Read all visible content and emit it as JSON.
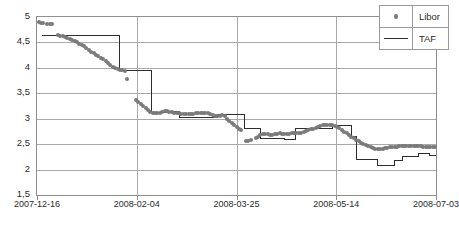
{
  "chart_data": {
    "type": "scatter",
    "title": "",
    "xlabel": "",
    "ylabel": "",
    "ylim": [
      1.5,
      5.0
    ],
    "ytick_values": [
      5,
      4.5,
      4,
      3.5,
      3,
      2.5,
      2,
      1.5
    ],
    "ytick_labels": [
      "5",
      "4,5",
      "4",
      "3,5",
      "3",
      "2,5",
      "2",
      "1,5"
    ],
    "xtick_labels": [
      "2007-12-16",
      "2008-02-04",
      "2008-03-25",
      "2008-05-14",
      "2008-07-03"
    ],
    "xtick_positions": [
      0,
      0.25,
      0.5,
      0.75,
      1.0
    ],
    "grid": true,
    "legend_position": "top-right",
    "colors": {
      "libor": "#7a7a7a",
      "taf": "#2e2e2e",
      "grid": "#a9a9a9",
      "frame": "#8e8e8e",
      "background": "#ffffff"
    },
    "series": [
      {
        "name": "Libor",
        "type": "scatter",
        "marker": "circle",
        "color": "#7a7a7a",
        "points": [
          [
            0.004,
            4.9
          ],
          [
            0.01,
            4.89
          ],
          [
            0.016,
            4.89
          ],
          [
            0.026,
            4.87
          ],
          [
            0.032,
            4.87
          ],
          [
            0.038,
            4.86
          ],
          [
            0.052,
            4.64
          ],
          [
            0.058,
            4.63
          ],
          [
            0.064,
            4.62
          ],
          [
            0.07,
            4.6
          ],
          [
            0.076,
            4.58
          ],
          [
            0.082,
            4.56
          ],
          [
            0.088,
            4.54
          ],
          [
            0.094,
            4.52
          ],
          [
            0.1,
            4.5
          ],
          [
            0.106,
            4.47
          ],
          [
            0.112,
            4.45
          ],
          [
            0.118,
            4.42
          ],
          [
            0.124,
            4.39
          ],
          [
            0.13,
            4.35
          ],
          [
            0.136,
            4.32
          ],
          [
            0.142,
            4.29
          ],
          [
            0.148,
            4.26
          ],
          [
            0.154,
            4.23
          ],
          [
            0.16,
            4.2
          ],
          [
            0.166,
            4.17
          ],
          [
            0.172,
            4.14
          ],
          [
            0.178,
            4.1
          ],
          [
            0.184,
            4.06
          ],
          [
            0.19,
            4.02
          ],
          [
            0.196,
            3.99
          ],
          [
            0.202,
            3.97
          ],
          [
            0.208,
            3.96
          ],
          [
            0.214,
            3.95
          ],
          [
            0.22,
            3.94
          ],
          [
            0.226,
            3.78
          ],
          [
            0.248,
            3.36
          ],
          [
            0.254,
            3.33
          ],
          [
            0.26,
            3.29
          ],
          [
            0.266,
            3.25
          ],
          [
            0.272,
            3.21
          ],
          [
            0.278,
            3.17
          ],
          [
            0.284,
            3.14
          ],
          [
            0.29,
            3.12
          ],
          [
            0.296,
            3.11
          ],
          [
            0.302,
            3.11
          ],
          [
            0.308,
            3.12
          ],
          [
            0.314,
            3.14
          ],
          [
            0.32,
            3.15
          ],
          [
            0.326,
            3.15
          ],
          [
            0.332,
            3.14
          ],
          [
            0.338,
            3.13
          ],
          [
            0.344,
            3.12
          ],
          [
            0.35,
            3.11
          ],
          [
            0.356,
            3.11
          ],
          [
            0.362,
            3.1
          ],
          [
            0.368,
            3.1
          ],
          [
            0.374,
            3.09
          ],
          [
            0.38,
            3.09
          ],
          [
            0.386,
            3.1
          ],
          [
            0.392,
            3.1
          ],
          [
            0.398,
            3.11
          ],
          [
            0.404,
            3.11
          ],
          [
            0.41,
            3.11
          ],
          [
            0.416,
            3.12
          ],
          [
            0.422,
            3.12
          ],
          [
            0.428,
            3.11
          ],
          [
            0.434,
            3.1
          ],
          [
            0.44,
            3.08
          ],
          [
            0.446,
            3.06
          ],
          [
            0.452,
            3.05
          ],
          [
            0.458,
            3.06
          ],
          [
            0.464,
            3.07
          ],
          [
            0.47,
            3.05
          ],
          [
            0.476,
            3.0
          ],
          [
            0.482,
            2.96
          ],
          [
            0.488,
            2.92
          ],
          [
            0.494,
            2.88
          ],
          [
            0.5,
            2.84
          ],
          [
            0.506,
            2.8
          ],
          [
            0.512,
            2.77
          ],
          [
            0.524,
            2.56
          ],
          [
            0.53,
            2.57
          ],
          [
            0.536,
            2.58
          ],
          [
            0.548,
            2.62
          ],
          [
            0.554,
            2.65
          ],
          [
            0.56,
            2.68
          ],
          [
            0.566,
            2.7
          ],
          [
            0.572,
            2.7
          ],
          [
            0.578,
            2.69
          ],
          [
            0.584,
            2.68
          ],
          [
            0.59,
            2.68
          ],
          [
            0.596,
            2.69
          ],
          [
            0.602,
            2.7
          ],
          [
            0.608,
            2.71
          ],
          [
            0.614,
            2.7
          ],
          [
            0.62,
            2.69
          ],
          [
            0.626,
            2.69
          ],
          [
            0.632,
            2.7
          ],
          [
            0.638,
            2.71
          ],
          [
            0.644,
            2.72
          ],
          [
            0.65,
            2.72
          ],
          [
            0.656,
            2.71
          ],
          [
            0.662,
            2.72
          ],
          [
            0.668,
            2.74
          ],
          [
            0.674,
            2.76
          ],
          [
            0.68,
            2.78
          ],
          [
            0.686,
            2.79
          ],
          [
            0.692,
            2.8
          ],
          [
            0.698,
            2.81
          ],
          [
            0.704,
            2.83
          ],
          [
            0.71,
            2.85
          ],
          [
            0.716,
            2.87
          ],
          [
            0.722,
            2.88
          ],
          [
            0.728,
            2.88
          ],
          [
            0.734,
            2.88
          ],
          [
            0.74,
            2.87
          ],
          [
            0.746,
            2.86
          ],
          [
            0.752,
            2.84
          ],
          [
            0.758,
            2.81
          ],
          [
            0.764,
            2.78
          ],
          [
            0.77,
            2.74
          ],
          [
            0.776,
            2.71
          ],
          [
            0.782,
            2.68
          ],
          [
            0.788,
            2.65
          ],
          [
            0.794,
            2.62
          ],
          [
            0.8,
            2.59
          ],
          [
            0.806,
            2.56
          ],
          [
            0.812,
            2.53
          ],
          [
            0.818,
            2.5
          ],
          [
            0.824,
            2.48
          ],
          [
            0.83,
            2.46
          ],
          [
            0.836,
            2.44
          ],
          [
            0.842,
            2.42
          ],
          [
            0.848,
            2.41
          ],
          [
            0.854,
            2.4
          ],
          [
            0.86,
            2.4
          ],
          [
            0.866,
            2.41
          ],
          [
            0.872,
            2.42
          ],
          [
            0.878,
            2.43
          ],
          [
            0.884,
            2.44
          ],
          [
            0.89,
            2.45
          ],
          [
            0.896,
            2.45
          ],
          [
            0.902,
            2.45
          ],
          [
            0.908,
            2.46
          ],
          [
            0.914,
            2.47
          ],
          [
            0.92,
            2.47
          ],
          [
            0.926,
            2.47
          ],
          [
            0.932,
            2.47
          ],
          [
            0.938,
            2.46
          ],
          [
            0.944,
            2.46
          ],
          [
            0.95,
            2.46
          ],
          [
            0.956,
            2.46
          ],
          [
            0.962,
            2.46
          ],
          [
            0.968,
            2.45
          ],
          [
            0.974,
            2.45
          ],
          [
            0.98,
            2.45
          ],
          [
            0.986,
            2.45
          ],
          [
            0.992,
            2.45
          ],
          [
            0.998,
            2.45
          ]
        ]
      },
      {
        "name": "TAF",
        "type": "step",
        "color": "#2e2e2e",
        "points": [
          [
            0.012,
            4.64
          ],
          [
            0.206,
            4.64
          ],
          [
            0.206,
            3.95
          ],
          [
            0.286,
            3.95
          ],
          [
            0.286,
            3.12
          ],
          [
            0.33,
            3.12
          ],
          [
            0.33,
            3.14
          ],
          [
            0.358,
            3.14
          ],
          [
            0.358,
            3.02
          ],
          [
            0.452,
            3.02
          ],
          [
            0.452,
            3.08
          ],
          [
            0.52,
            3.08
          ],
          [
            0.52,
            2.8
          ],
          [
            0.56,
            2.8
          ],
          [
            0.56,
            2.62
          ],
          [
            0.62,
            2.62
          ],
          [
            0.62,
            2.6
          ],
          [
            0.648,
            2.6
          ],
          [
            0.648,
            2.8
          ],
          [
            0.74,
            2.8
          ],
          [
            0.74,
            2.86
          ],
          [
            0.788,
            2.86
          ],
          [
            0.788,
            2.65
          ],
          [
            0.8,
            2.65
          ],
          [
            0.8,
            2.2
          ],
          [
            0.854,
            2.2
          ],
          [
            0.854,
            2.08
          ],
          [
            0.896,
            2.08
          ],
          [
            0.896,
            2.18
          ],
          [
            0.916,
            2.18
          ],
          [
            0.916,
            2.26
          ],
          [
            0.956,
            2.26
          ],
          [
            0.956,
            2.32
          ],
          [
            0.984,
            2.32
          ],
          [
            0.984,
            2.28
          ],
          [
            1.0,
            2.28
          ]
        ]
      }
    ]
  },
  "legend": {
    "items": [
      {
        "label": "Libor",
        "marker": "dot"
      },
      {
        "label": "TAF",
        "marker": "line"
      }
    ]
  }
}
